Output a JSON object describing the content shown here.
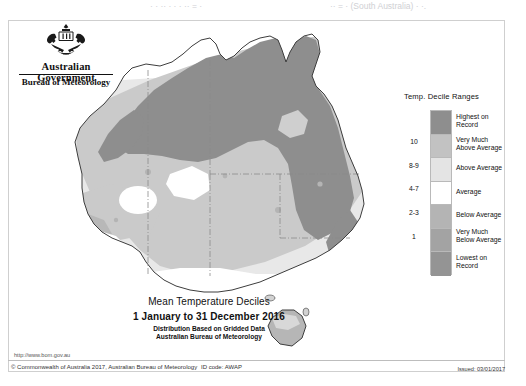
{
  "top_strip": {
    "fragment_left": "·  ·   ·· ·  · ·          ·· =   ·",
    "fragment_right": "·· =  ·  (South Australia)   ·  ·."
  },
  "header": {
    "government_label": "Australian Government",
    "agency_label": "Bureau of Meteorology",
    "crest_icon": "australian-coat-of-arms-icon"
  },
  "legend": {
    "title": "Temp. Decile Ranges",
    "entries": [
      {
        "decile": "",
        "label": "Highest on\nRecord",
        "label_line1": "Highest on",
        "label_line2": "Record",
        "color": "#8e8e8e"
      },
      {
        "decile": "10",
        "label": "Very Much Above Average",
        "label_line1": "Very Much",
        "label_line2": "Above Average",
        "color": "#c2c2c2"
      },
      {
        "decile": "8-9",
        "label": "Above Average",
        "label_line1": "Above Average",
        "label_line2": "",
        "color": "#e4e4e4"
      },
      {
        "decile": "4-7",
        "label": "Average",
        "label_line1": "Average",
        "label_line2": "",
        "color": "#ffffff"
      },
      {
        "decile": "2-3",
        "label": "Below Average",
        "label_line1": "Below Average",
        "label_line2": "",
        "color": "#b4b4b4"
      },
      {
        "decile": "1",
        "label": "Very Much Below Average",
        "label_line1": "Very Much",
        "label_line2": "Below Average",
        "color": "#a3a3a3"
      },
      {
        "decile": "",
        "label": "Lowest on Record",
        "label_line1": "Lowest on",
        "label_line2": "Record",
        "color": "#949494"
      }
    ]
  },
  "title_block": {
    "line1": "Mean Temperature Deciles",
    "line2": "1 January to 31 December 2016",
    "line3": "Distribution Based on Gridded Data",
    "line4": "Australian Bureau of Meteorology"
  },
  "footer": {
    "url": "http://www.bom.gov.au",
    "copyright": "© Commonwealth of Australia 2017, Australian Bureau of Meteorology",
    "id_code": "ID code: AWAP",
    "issued": "Issued: 03/01/2017"
  },
  "map": {
    "name": "australia-temperature-decile-map",
    "projection_note": "Australia including Tasmania, state boundaries shown as dash-dot lines",
    "colors": {
      "highest_on_record": "#8e8e8e",
      "very_much_above": "#c2c2c2",
      "above_average": "#e4e4e4",
      "average": "#ffffff",
      "coastline": "#3a3a3a",
      "state_border": "#7a7a7a"
    }
  }
}
